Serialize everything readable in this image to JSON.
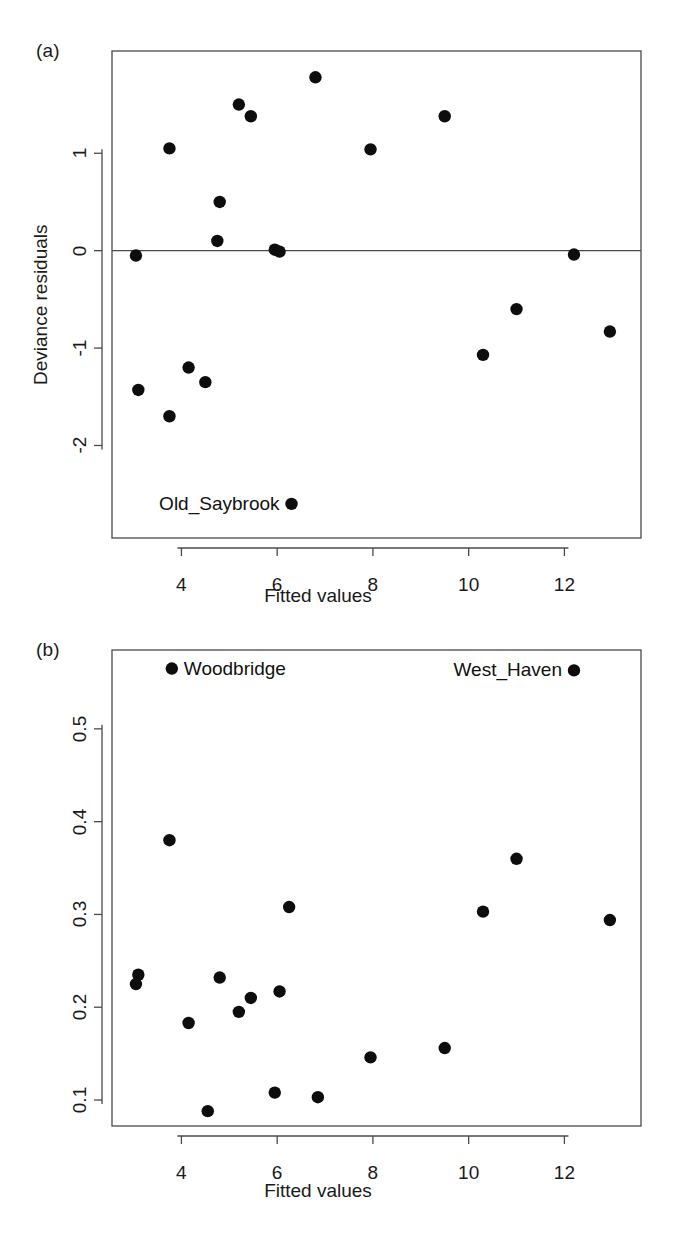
{
  "figure": {
    "panels": [
      {
        "tag": "(a)",
        "xlabel": "Fitted values",
        "ylabel": "Deviance residuals"
      },
      {
        "tag": "(b)",
        "xlabel": "Fitted values",
        "ylabel": "Hat diagonals"
      }
    ]
  },
  "chart_data": [
    {
      "type": "scatter",
      "title": "(a)",
      "xlabel": "Fitted values",
      "ylabel": "Deviance residuals",
      "xlim": [
        2.55,
        13.6
      ],
      "ylim": [
        -2.95,
        2.05
      ],
      "xticks": [
        4,
        6,
        8,
        10,
        12
      ],
      "xtick_labels": [
        "4",
        "6",
        "8",
        "10",
        "12"
      ],
      "yticks": [
        1,
        0,
        -1,
        -2
      ],
      "ytick_labels": [
        "1",
        "0",
        "-1",
        "-2"
      ],
      "grid": false,
      "legend": "none",
      "reference_lines": [
        {
          "type": "hline",
          "y": 0
        }
      ],
      "x": [
        3.05,
        3.1,
        3.75,
        3.75,
        4.15,
        4.5,
        4.75,
        4.8,
        5.2,
        5.45,
        5.95,
        6.05,
        6.3,
        6.8,
        7.95,
        9.5,
        10.3,
        11.0,
        12.2,
        12.95
      ],
      "y": [
        -0.05,
        -1.43,
        1.05,
        -1.7,
        -1.2,
        -1.35,
        0.1,
        0.5,
        1.5,
        1.38,
        0.01,
        -0.01,
        -2.6,
        1.78,
        1.04,
        1.38,
        -1.07,
        -0.6,
        -0.04,
        -0.83
      ],
      "annotations": [
        {
          "text": "Old_Saybrook",
          "x": 6.3,
          "y": -2.6,
          "position": "left-of-point"
        }
      ]
    },
    {
      "type": "scatter",
      "title": "(b)",
      "xlabel": "Fitted values",
      "ylabel": "Hat diagonals",
      "xlim": [
        2.55,
        13.6
      ],
      "ylim": [
        0.072,
        0.585
      ],
      "xticks": [
        4,
        6,
        8,
        10,
        12
      ],
      "xtick_labels": [
        "4",
        "6",
        "8",
        "10",
        "12"
      ],
      "yticks": [
        0.5,
        0.4,
        0.3,
        0.2,
        0.1
      ],
      "ytick_labels": [
        "0.5",
        "0.4",
        "0.3",
        "0.2",
        "0.1"
      ],
      "grid": false,
      "legend": "none",
      "x": [
        3.05,
        3.1,
        3.75,
        3.8,
        4.15,
        4.55,
        4.8,
        5.2,
        5.45,
        5.95,
        6.05,
        6.25,
        6.85,
        7.95,
        9.5,
        10.3,
        11.0,
        12.2,
        12.95
      ],
      "y": [
        0.225,
        0.235,
        0.38,
        0.565,
        0.183,
        0.088,
        0.232,
        0.195,
        0.21,
        0.108,
        0.217,
        0.308,
        0.103,
        0.146,
        0.156,
        0.303,
        0.36,
        0.563,
        0.294
      ],
      "annotations": [
        {
          "text": "Woodbridge",
          "x": 3.8,
          "y": 0.565,
          "position": "right-of-point"
        },
        {
          "text": "West_Haven",
          "x": 12.2,
          "y": 0.563,
          "position": "left-of-point"
        }
      ]
    }
  ],
  "colors": {
    "point": "#0d0d0d",
    "axis": "#4a4a4a",
    "background": "#ffffff",
    "text": "#1a1a1a"
  }
}
